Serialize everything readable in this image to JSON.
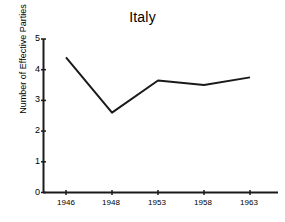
{
  "chart_data": {
    "type": "line",
    "title": "Italy",
    "xlabel": "",
    "ylabel": "Number of Effective Parties",
    "categories": [
      "1946",
      "1948",
      "1953",
      "1958",
      "1963"
    ],
    "values": [
      4.4,
      2.6,
      3.65,
      3.5,
      3.75
    ],
    "series": [
      {
        "name": "Number of Effective Parties",
        "values": [
          4.4,
          2.6,
          3.65,
          3.5,
          3.75
        ]
      }
    ],
    "ylim": [
      0,
      5
    ],
    "y_ticks": [
      "0",
      "1",
      "2",
      "3",
      "4",
      "5"
    ],
    "x_ticks": [
      "1946",
      "1948",
      "1953",
      "1958",
      "1963"
    ],
    "grid": false,
    "legend": false,
    "legend_position": "none",
    "line_color": "#1a1a1a",
    "axis_color": "#1a1a1a",
    "background_color": "#ffffff"
  }
}
